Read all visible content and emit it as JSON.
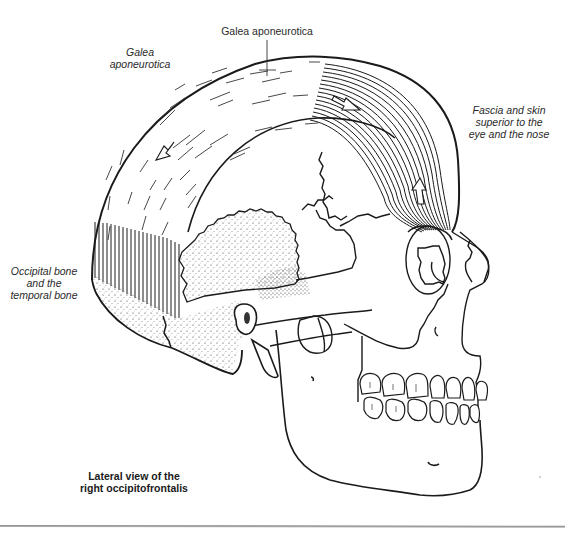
{
  "figure": {
    "caption": {
      "line1": "Lateral view of the",
      "line2": "right occipitofrontalis"
    },
    "labels": {
      "galea_top": "Galea aponeurotica",
      "galea_left": {
        "line1": "Galea",
        "line2": "aponeurotica"
      },
      "fascia_right": {
        "line1": "Fascia and skin",
        "line2": "superior to the",
        "line3": "eye and the nose"
      },
      "occipital_left": {
        "line1": "Occipital bone",
        "line2": "and the",
        "line3": "temporal bone"
      }
    },
    "structures": [
      "galea-aponeurotica",
      "frontalis-muscle-belly",
      "occipitalis-muscle-belly",
      "skull",
      "mandible",
      "teeth",
      "orbit",
      "nasal-bone",
      "temporal-bone",
      "mastoid-process",
      "zygomatic-arch"
    ],
    "arrows": [
      {
        "location": "galea-left",
        "direction": "down-left"
      },
      {
        "location": "frontalis-upper",
        "direction": "down-right"
      },
      {
        "location": "frontalis-lower",
        "direction": "up"
      }
    ],
    "colors": {
      "ink": "#1a1a1a",
      "background": "#ffffff",
      "rule": "#9a9a9a"
    }
  }
}
